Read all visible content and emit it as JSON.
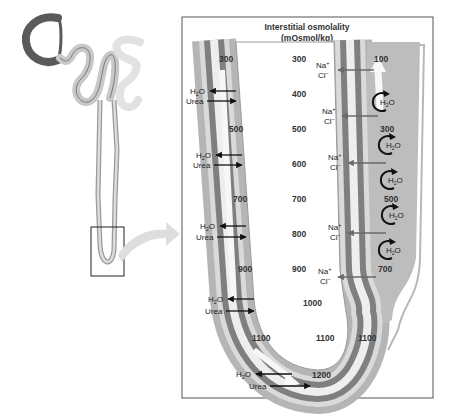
{
  "panel": {
    "title_line1": "Interstitial osmolality",
    "title_line2": "(mOsmol/kg)"
  },
  "interstitial_values": [
    {
      "label": "300",
      "x": 292,
      "y": 62
    },
    {
      "label": "400",
      "x": 292,
      "y": 97
    },
    {
      "label": "500",
      "x": 292,
      "y": 132
    },
    {
      "label": "600",
      "x": 292,
      "y": 167
    },
    {
      "label": "700",
      "x": 292,
      "y": 202
    },
    {
      "label": "800",
      "x": 292,
      "y": 237
    },
    {
      "label": "900",
      "x": 292,
      "y": 272
    },
    {
      "label": "1000",
      "x": 303,
      "y": 306
    },
    {
      "label": "1100",
      "x": 316,
      "y": 341
    }
  ],
  "descending_limb_values": [
    {
      "label": "300",
      "x": 228,
      "y": 62
    },
    {
      "label": "500",
      "x": 236,
      "y": 132
    },
    {
      "label": "700",
      "x": 240,
      "y": 202
    },
    {
      "label": "900",
      "x": 245,
      "y": 272
    },
    {
      "label": "1100",
      "x": 256,
      "y": 341
    },
    {
      "label": "1200",
      "x": 320,
      "y": 376
    }
  ],
  "ascending_limb_values": [
    {
      "label": "100",
      "x": 382,
      "y": 62
    },
    {
      "label": "300",
      "x": 386,
      "y": 132
    },
    {
      "label": "500",
      "x": 392,
      "y": 202
    },
    {
      "label": "700",
      "x": 386,
      "y": 272
    },
    {
      "label": "1100",
      "x": 368,
      "y": 341
    }
  ],
  "h2o_urea_labels": [
    {
      "h2o": "H2O",
      "urea": "Urea",
      "x": 190,
      "y": 94
    },
    {
      "h2o": "H2O",
      "urea": "Urea",
      "x": 195,
      "y": 158
    },
    {
      "h2o": "H2O",
      "urea": "Urea",
      "x": 200,
      "y": 228
    },
    {
      "h2o": "H2O",
      "urea": "Urea",
      "x": 206,
      "y": 299
    },
    {
      "h2o": "H2O",
      "urea": "Urea",
      "x": 236,
      "y": 373
    }
  ],
  "nacl_labels": [
    {
      "na": "Na+",
      "cl": "Cl−",
      "x": 323,
      "y": 68
    },
    {
      "na": "Na+",
      "cl": "Cl−",
      "x": 328,
      "y": 117
    },
    {
      "na": "Na+",
      "cl": "Cl−",
      "x": 332,
      "y": 163
    },
    {
      "na": "Na+",
      "cl": "Cl−",
      "x": 332,
      "y": 233
    },
    {
      "na": "Na+",
      "cl": "Cl−",
      "x": 323,
      "y": 275
    }
  ],
  "ascending_h2o_curls": [
    {
      "label": "H2O",
      "x": 382,
      "y": 100
    },
    {
      "label": "H2O",
      "x": 390,
      "y": 145
    },
    {
      "label": "H2O",
      "x": 392,
      "y": 180
    },
    {
      "label": "H2O",
      "x": 392,
      "y": 215
    },
    {
      "label": "H2O",
      "x": 390,
      "y": 250
    }
  ],
  "colors": {
    "tube_outer": "#b5b5b5",
    "tube_light": "#d9d9d9",
    "tube_dark": "#7a7a7a",
    "lumen": "#eeeeee",
    "arrow_black": "#111111",
    "arrow_gray": "#6a6a6a",
    "frame": "#555555"
  }
}
